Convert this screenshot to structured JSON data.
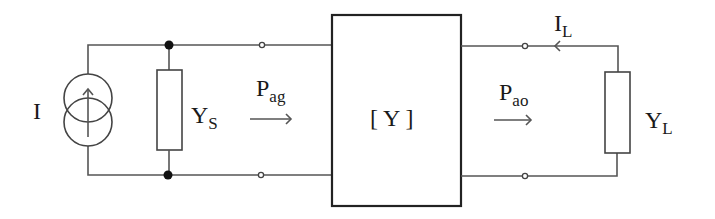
{
  "diagram": {
    "type": "two-port network with current source and load",
    "colors": {
      "wire": "#555555",
      "box": "#222222",
      "junction": "#111111",
      "text": "#1a1a1a",
      "background": "#ffffff"
    },
    "source": {
      "label": "I",
      "kind": "current-source"
    },
    "source_admittance": {
      "main": "Y",
      "sub": "S"
    },
    "available_power_generator": {
      "main": "P",
      "sub": "ag",
      "arrow": "→"
    },
    "two_port": {
      "label": "[ Y ]"
    },
    "available_power_output": {
      "main": "P",
      "sub": "ao",
      "arrow": "→"
    },
    "load_current": {
      "main": "I",
      "sub": "L"
    },
    "load_admittance": {
      "main": "Y",
      "sub": "L"
    }
  }
}
